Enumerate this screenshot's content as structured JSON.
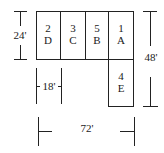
{
  "diagram": {
    "type": "floor-plan-layout",
    "cells": [
      {
        "number": "2",
        "letter": "D"
      },
      {
        "number": "3",
        "letter": "C"
      },
      {
        "number": "5",
        "letter": "B"
      },
      {
        "number": "1",
        "letter": "A"
      },
      {
        "number": "4",
        "letter": "E"
      }
    ],
    "dimensions": {
      "height_row": "24'",
      "total_height": "48'",
      "cell_width": "18'",
      "total_width": "72'"
    }
  }
}
